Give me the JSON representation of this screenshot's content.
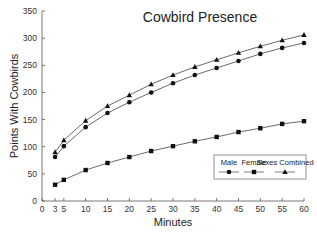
{
  "chart_data": {
    "type": "line",
    "title": "Cowbird Presence",
    "xlabel": "Minutes",
    "ylabel": "Points With Cowbirds",
    "x": [
      3,
      5,
      10,
      15,
      20,
      25,
      30,
      35,
      40,
      45,
      50,
      55,
      60
    ],
    "xlim": [
      0,
      60
    ],
    "ylim": [
      0,
      350
    ],
    "xticks": [
      0,
      3,
      5,
      10,
      15,
      20,
      25,
      30,
      35,
      40,
      45,
      50,
      55,
      60
    ],
    "yticks": [
      0,
      50,
      100,
      150,
      200,
      250,
      300,
      350
    ],
    "grid": false,
    "legend_position": "lower right, inside plot",
    "series": [
      {
        "name": "Male",
        "marker": "circle",
        "values": [
          81,
          101,
          136,
          162,
          182,
          200,
          217,
          232,
          245,
          258,
          271,
          282,
          291
        ]
      },
      {
        "name": "Female",
        "marker": "square",
        "values": [
          30,
          39,
          57,
          70,
          81,
          92,
          101,
          110,
          118,
          127,
          134,
          142,
          147
        ]
      },
      {
        "name": "Sexes Combined",
        "marker": "triangle",
        "values": [
          90,
          112,
          148,
          175,
          195,
          215,
          232,
          247,
          260,
          273,
          285,
          296,
          306
        ]
      }
    ]
  }
}
